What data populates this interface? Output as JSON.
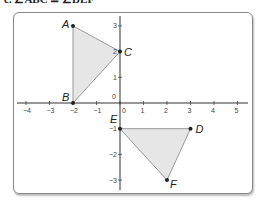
{
  "header_text": "c. ∠ABC ≅ ∠DEF",
  "axes": {
    "x_ticks": [
      "-4",
      "-3",
      "-2",
      "-1",
      "0",
      "1",
      "2",
      "3",
      "4",
      "5"
    ],
    "y_ticks": [
      "3",
      "2",
      "1",
      "0",
      "-1",
      "-2",
      "-3"
    ],
    "xlim": [
      -4.5,
      5.5
    ],
    "ylim": [
      -3.4,
      3.4
    ]
  },
  "triangle_abc": {
    "points": [
      {
        "label": "A",
        "x": -2,
        "y": 3
      },
      {
        "label": "B",
        "x": -2,
        "y": 0
      },
      {
        "label": "C",
        "x": 0,
        "y": 2
      }
    ]
  },
  "triangle_def": {
    "points": [
      {
        "label": "D",
        "x": 3,
        "y": -1
      },
      {
        "label": "E",
        "x": 0,
        "y": -1
      },
      {
        "label": "F",
        "x": 2,
        "y": -3
      }
    ]
  },
  "colors": {
    "fill": "#e6e6e6",
    "stroke": "#999999",
    "axis": "#333333",
    "point": "#222222"
  }
}
